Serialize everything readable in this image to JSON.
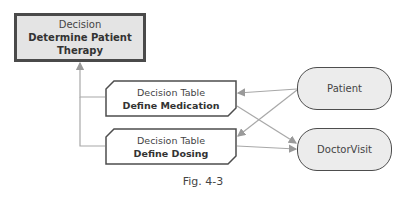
{
  "diagram": {
    "decision": {
      "kind": "Decision",
      "title_line1": "Determine Patient",
      "title_line2": "Therapy"
    },
    "decision_tables": [
      {
        "kind": "Decision Table",
        "title": "Define Medication"
      },
      {
        "kind": "Decision Table",
        "title": "Define Dosing"
      }
    ],
    "inputs": [
      {
        "label": "Patient"
      },
      {
        "label": "DoctorVisit"
      }
    ],
    "edges": [
      {
        "from": "Define Medication",
        "to": "Determine Patient Therapy"
      },
      {
        "from": "Define Dosing",
        "to": "Determine Patient Therapy"
      },
      {
        "from": "Patient",
        "to": "Define Medication"
      },
      {
        "from": "Patient",
        "to": "Define Dosing"
      },
      {
        "from": "DoctorVisit",
        "to": "Define Medication"
      },
      {
        "from": "DoctorVisit",
        "to": "Define Dosing"
      }
    ],
    "colors": {
      "border": "#4a4a4a",
      "fill": "#e4e4e4",
      "connector": "#a8a8a8"
    }
  },
  "caption": "Fig. 4-3"
}
